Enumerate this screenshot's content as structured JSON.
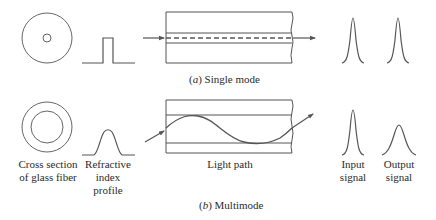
{
  "figure": {
    "panels": [
      {
        "id": "a",
        "caption_letter": "a",
        "caption_text": "Single mode",
        "core": "small",
        "profile": "step",
        "light_path": "straight",
        "signal_spread": "none"
      },
      {
        "id": "b",
        "caption_letter": "b",
        "caption_text": "Multimode",
        "core": "large",
        "profile": "graded",
        "light_path": "sinusoidal",
        "signal_spread": "broadened"
      }
    ],
    "labels": {
      "cross_section_line1": "Cross section",
      "cross_section_line2": "of glass fiber",
      "profile_line1": "Refractive",
      "profile_line2": "index",
      "profile_line3": "profile",
      "light_path": "Light path",
      "input_line1": "Input",
      "input_line2": "signal",
      "output_line1": "Output",
      "output_line2": "signal"
    },
    "colors": {
      "stroke": "#555555",
      "text": "#2a2a2a"
    }
  }
}
